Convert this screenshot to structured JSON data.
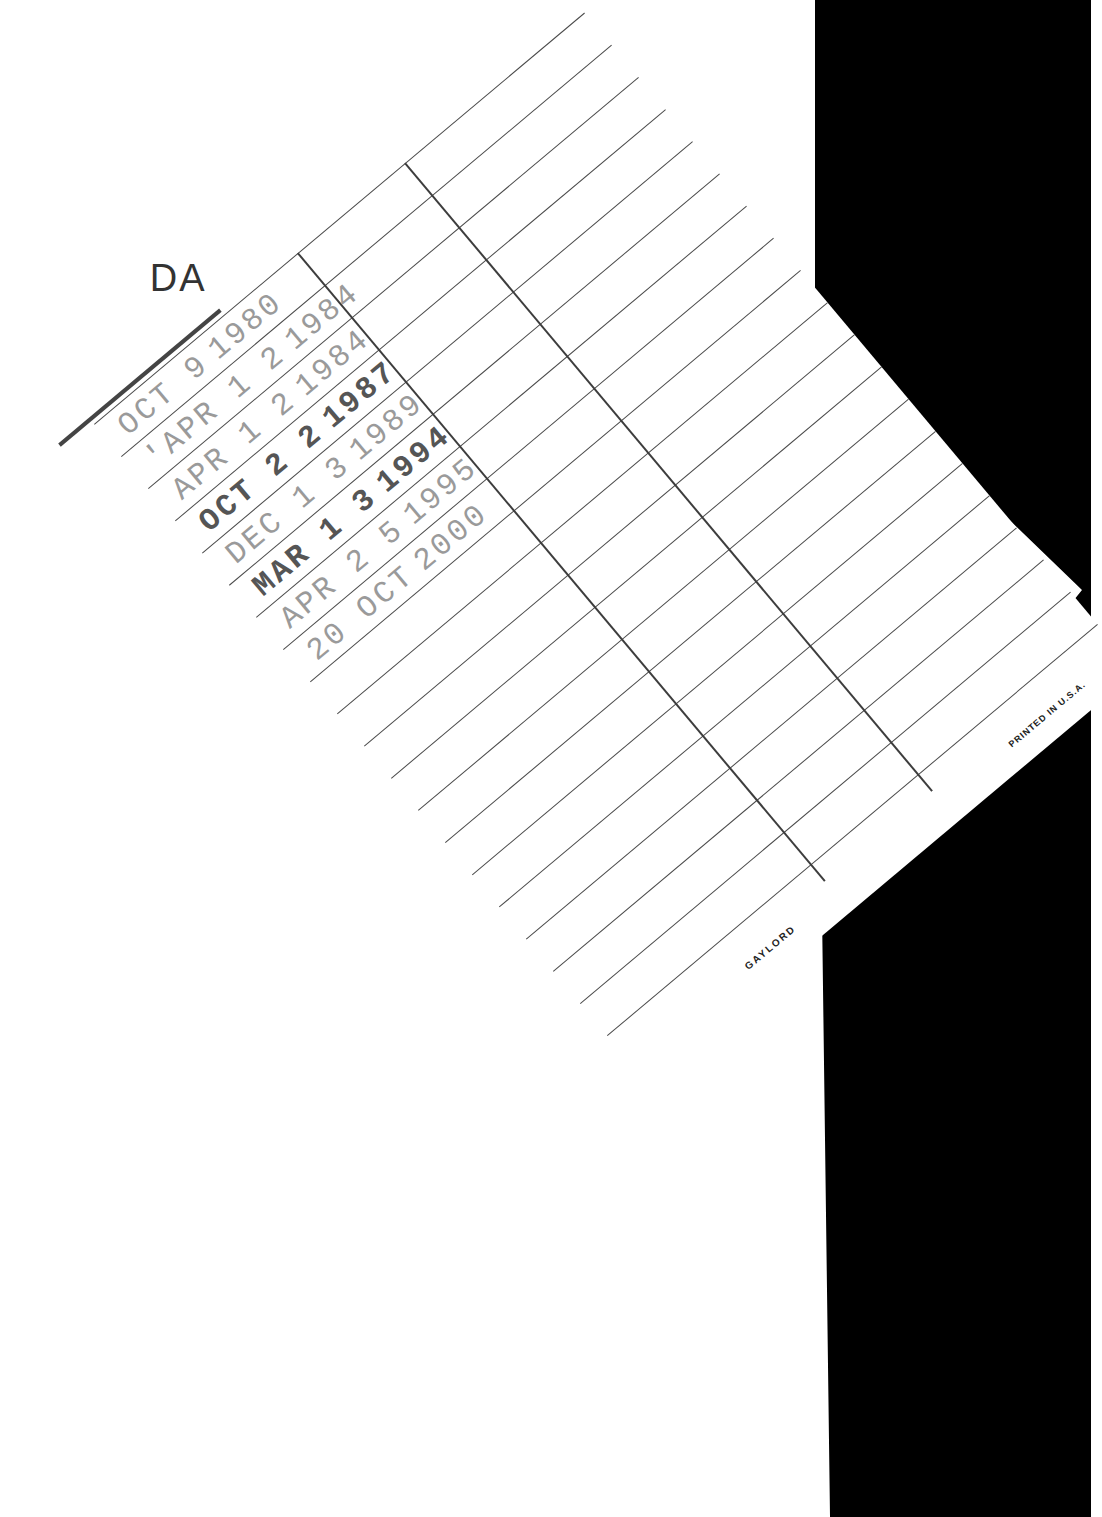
{
  "card": {
    "header": "DA",
    "header_full_obscured": "DATE DUE",
    "brand": "GAYLORD",
    "imprint": "PRINTED IN U.S.A.",
    "row_count": 20,
    "column_count": 3
  },
  "stamps": [
    {
      "month_day": "OCT 9",
      "year": "1980",
      "tone": "light"
    },
    {
      "month_day": "'APR 1 2",
      "year": "1984",
      "tone": "light"
    },
    {
      "month_day": "APR 1 2",
      "year": "1984",
      "tone": "light"
    },
    {
      "month_day": "OCT 2 2",
      "year": "1987",
      "tone": "dark"
    },
    {
      "month_day": "DEC 1 3",
      "year": "1989",
      "tone": "light"
    },
    {
      "month_day": "MAR 1 3",
      "year": "1994",
      "tone": "dark"
    },
    {
      "month_day": "APR 2 5",
      "year": "1995",
      "tone": "light"
    },
    {
      "month_day": "20 OCT",
      "year": "2000",
      "tone": "light"
    }
  ],
  "colors": {
    "paper": "#ffffff",
    "background_right": "#000000",
    "rule_lines": "#4a4a4a",
    "stamp_light": "#9a9a9a",
    "stamp_dark": "#555555"
  }
}
